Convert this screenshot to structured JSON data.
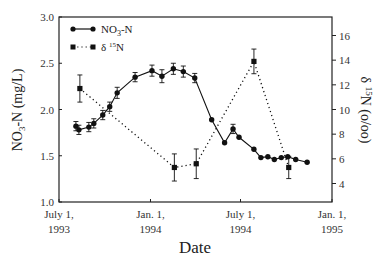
{
  "chart_data": {
    "type": "line",
    "title": "",
    "xlabel": "Date",
    "ylabel_left": "NO3-N (mg/L)",
    "ylabel_right": "δ 15N (o/oo)",
    "x_ticks": [
      {
        "date": "1993-07-01",
        "line1": "July 1,",
        "line2": "1993"
      },
      {
        "date": "1994-01-01",
        "line1": "Jan. 1,",
        "line2": "1994"
      },
      {
        "date": "1994-07-01",
        "line1": "July 1,",
        "line2": "1994"
      },
      {
        "date": "1995-01-01",
        "line1": "Jan. 1,",
        "line2": "1995"
      }
    ],
    "xlim": [
      "1993-07-01",
      "1995-01-01"
    ],
    "ylim_left": [
      1.0,
      3.0
    ],
    "ylim_right": [
      2.5,
      17.5
    ],
    "y_ticks_left": [
      "1.0",
      "1.5",
      "2.0",
      "2.5",
      "3.0"
    ],
    "y_ticks_right": [
      "4",
      "6",
      "8",
      "10",
      "12",
      "14",
      "16"
    ],
    "grid": false,
    "legend_position": "top-left",
    "series": [
      {
        "name": "NO3-N",
        "axis": "left",
        "style": "solid line, circle markers",
        "points": [
          {
            "date": "1993-08-04",
            "value": 1.82,
            "err": 0.05
          },
          {
            "date": "1993-08-10",
            "value": 1.78,
            "err": 0.05
          },
          {
            "date": "1993-08-30",
            "value": 1.81,
            "err": 0.05
          },
          {
            "date": "1993-09-09",
            "value": 1.85,
            "err": 0.05
          },
          {
            "date": "1993-09-27",
            "value": 1.94,
            "err": 0.05
          },
          {
            "date": "1993-10-11",
            "value": 2.03,
            "err": 0.05
          },
          {
            "date": "1993-10-26",
            "value": 2.18,
            "err": 0.06
          },
          {
            "date": "1993-12-01",
            "value": 2.35,
            "err": 0.05
          },
          {
            "date": "1994-01-04",
            "value": 2.42,
            "err": 0.06
          },
          {
            "date": "1994-01-24",
            "value": 2.36,
            "err": 0.07
          },
          {
            "date": "1994-02-16",
            "value": 2.44,
            "err": 0.06
          },
          {
            "date": "1994-03-08",
            "value": 2.41,
            "err": 0.06
          },
          {
            "date": "1994-03-31",
            "value": 2.34,
            "err": 0.05
          },
          {
            "date": "1994-05-04",
            "value": 1.89,
            "err": 0.0
          },
          {
            "date": "1994-05-30",
            "value": 1.64,
            "err": 0.0
          },
          {
            "date": "1994-06-16",
            "value": 1.79,
            "err": 0.05
          },
          {
            "date": "1994-06-28",
            "value": 1.7,
            "err": 0.0
          },
          {
            "date": "1994-07-28",
            "value": 1.57,
            "err": 0.0
          },
          {
            "date": "1994-08-11",
            "value": 1.48,
            "err": 0.0
          },
          {
            "date": "1994-08-25",
            "value": 1.49,
            "err": 0.0
          },
          {
            "date": "1994-09-07",
            "value": 1.46,
            "err": 0.0
          },
          {
            "date": "1994-09-21",
            "value": 1.48,
            "err": 0.0
          },
          {
            "date": "1994-10-04",
            "value": 1.49,
            "err": 0.0
          },
          {
            "date": "1994-10-20",
            "value": 1.46,
            "err": 0.0
          },
          {
            "date": "1994-11-12",
            "value": 1.43,
            "err": 0.0
          }
        ]
      },
      {
        "name": "δ 15N",
        "axis": "right",
        "style": "dotted line, square markers",
        "points": [
          {
            "date": "1993-08-12",
            "value": 11.7,
            "err": 1.1
          },
          {
            "date": "1994-02-18",
            "value": 5.3,
            "err": 1.1
          },
          {
            "date": "1994-04-03",
            "value": 5.6,
            "err": 1.2
          },
          {
            "date": "1994-07-28",
            "value": 13.9,
            "err": 1.0
          },
          {
            "date": "1994-10-06",
            "value": 5.3,
            "err": 0.9
          }
        ]
      }
    ],
    "legend": [
      {
        "label": "NO",
        "sub": "3",
        "rest": "-N",
        "series": "NO3-N"
      },
      {
        "label": "δ ",
        "sup": "15",
        "rest": "N",
        "series": "δ 15N"
      }
    ]
  }
}
